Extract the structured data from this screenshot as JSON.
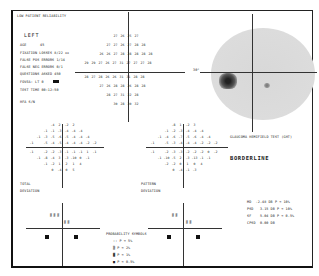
{
  "header": {
    "reliability_warning": "LOW PATIENT RELIABILITY",
    "eye": "LEFT",
    "age_label": "AGE",
    "age_value": "45",
    "fixation_losses": "FIXATION LOSSES   8/22 xx",
    "false_pos": "FALSE POS ERRORS   1/14",
    "false_neg": "FALSE NEG ERRORS   0/1",
    "questions_asked": "QUESTIONS ASKED   450",
    "fovea": "FOVEA:  LT 0",
    "test_time": "TEST TIME 00:12:50",
    "hfa": "HFA S/N"
  },
  "threshold": {
    "rows": [
      [
        "",
        "",
        "",
        "27",
        "26",
        "25",
        "27",
        "",
        "",
        ""
      ],
      [
        "",
        "",
        "27",
        "27",
        "26",
        "27",
        "28",
        "28",
        "",
        ""
      ],
      [
        "",
        "26",
        "26",
        "27",
        "28",
        "28",
        "28",
        "28",
        "28",
        ""
      ],
      [
        "29",
        "29",
        "27",
        "26",
        "27",
        "31",
        "27",
        "27",
        "27",
        "28"
      ],
      [
        "28",
        "27",
        "28",
        "26",
        "26",
        "31",
        "31",
        "28",
        "28",
        ""
      ],
      [
        "",
        "27",
        "26",
        "28",
        "28",
        "26",
        "28",
        "28",
        "",
        ""
      ],
      [
        "",
        "",
        "28",
        "27",
        "31",
        "32",
        "28",
        "",
        "",
        ""
      ],
      [
        "",
        "",
        "",
        "30",
        "28",
        "30",
        "32",
        "",
        "",
        ""
      ]
    ],
    "degree_label": "30°"
  },
  "grayscale": {
    "degree_label": "30°",
    "caption": "GLAUCOMA HEMIFIELD TEST (GHT)"
  },
  "result": "BORDERLINE",
  "total_deviation": {
    "title_1": "TOTAL",
    "title_2": "DEVIATION",
    "rows": [
      [
        "",
        "",
        "",
        "-4",
        "2",
        "-2",
        "2",
        "",
        "",
        ""
      ],
      [
        "",
        "",
        "-1",
        "-1",
        "-3",
        "-4",
        "-4",
        "-4",
        "",
        ""
      ],
      [
        "",
        "-1",
        "-3",
        "-5",
        "-6",
        "-5",
        "-4",
        "-4",
        "-4",
        ""
      ],
      [
        "-1",
        "",
        "-5",
        "-4",
        "-5",
        "-4",
        "-4",
        "-4",
        "-2",
        "-2"
      ],
      [
        "-1",
        "",
        "-2",
        "-2",
        "-3",
        "-1",
        "-1",
        "-1",
        "1",
        "-1"
      ],
      [
        "",
        "-1",
        "-8",
        "-4",
        "3",
        "-3",
        "-10",
        "0",
        "-1",
        ""
      ],
      [
        "",
        "",
        "-1",
        "-2",
        "1",
        "2",
        "1",
        "4",
        "",
        ""
      ],
      [
        "",
        "",
        "",
        "0",
        "-4",
        "0",
        "5",
        "",
        "",
        ""
      ]
    ]
  },
  "pattern_deviation": {
    "title_1": "PATTERN",
    "title_2": "DEVIATION",
    "rows": [
      [
        "",
        "",
        "",
        "-8",
        "1",
        "-2",
        "3",
        "",
        "",
        ""
      ],
      [
        "",
        "",
        "-1",
        "-2",
        "-3",
        "-4",
        "-4",
        "-4",
        "",
        ""
      ],
      [
        "",
        "-1",
        "-4",
        "-6",
        "-7",
        "-5",
        "-6",
        "-4",
        "-4",
        ""
      ],
      [
        "-1",
        "",
        "-5",
        "-3",
        "-4",
        "-4",
        "-4",
        "-2",
        "-2",
        "-2"
      ],
      [
        "-1",
        "",
        "-2",
        "-3",
        "-3",
        "-2",
        "-2",
        "-2",
        "0",
        "-2"
      ],
      [
        "",
        "-1",
        "-10",
        "-5",
        "2",
        "-3",
        "-13",
        "-1",
        "-1",
        ""
      ],
      [
        "",
        "",
        "-2",
        "-2",
        "0",
        "1",
        "0",
        "4",
        "",
        ""
      ],
      [
        "",
        "",
        "",
        "0",
        "-4",
        "-1",
        "-3",
        "",
        "",
        ""
      ]
    ]
  },
  "indices": [
    {
      "name": "MD",
      "value": "-2.48 DB",
      "p": "P < 10%"
    },
    {
      "name": "PSD",
      "value": "3.15 DB",
      "p": "P < 10%"
    },
    {
      "name": "SF",
      "value": "5.04 DB",
      "p": "P < 0.5%"
    },
    {
      "name": "CPSD",
      "value": "0.00 DB",
      "p": ""
    }
  ],
  "legend": {
    "title": "PROBABILITY SYMBOLS",
    "items": [
      {
        "symbol": "::",
        "label": "P <  5%"
      },
      {
        "symbol": "▒",
        "label": "P <  2%"
      },
      {
        "symbol": "▓",
        "label": "P <  1%"
      },
      {
        "symbol": "■",
        "label": "P < 0.5%"
      }
    ]
  }
}
